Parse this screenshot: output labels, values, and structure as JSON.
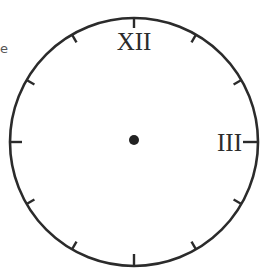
{
  "fragment_text": "e",
  "clock": {
    "center": [
      134,
      142
    ],
    "radius": 124,
    "stroke_color": "#2b2b2b",
    "numerals": {
      "twelve": "XII",
      "three": "III"
    },
    "tick_count": 12,
    "center_dot": true
  }
}
